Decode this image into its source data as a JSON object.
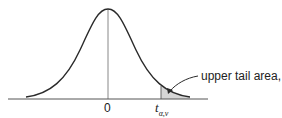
{
  "diagram": {
    "type": "t-distribution upper tail",
    "curve_color": "#2a2a2a",
    "shade_color": "#d6d6d6",
    "axis_color": "#555555"
  },
  "labels": {
    "zero": "0",
    "critical_main": "t",
    "critical_sub": "α,ν",
    "tail_annotation": "upper tail area, α"
  }
}
